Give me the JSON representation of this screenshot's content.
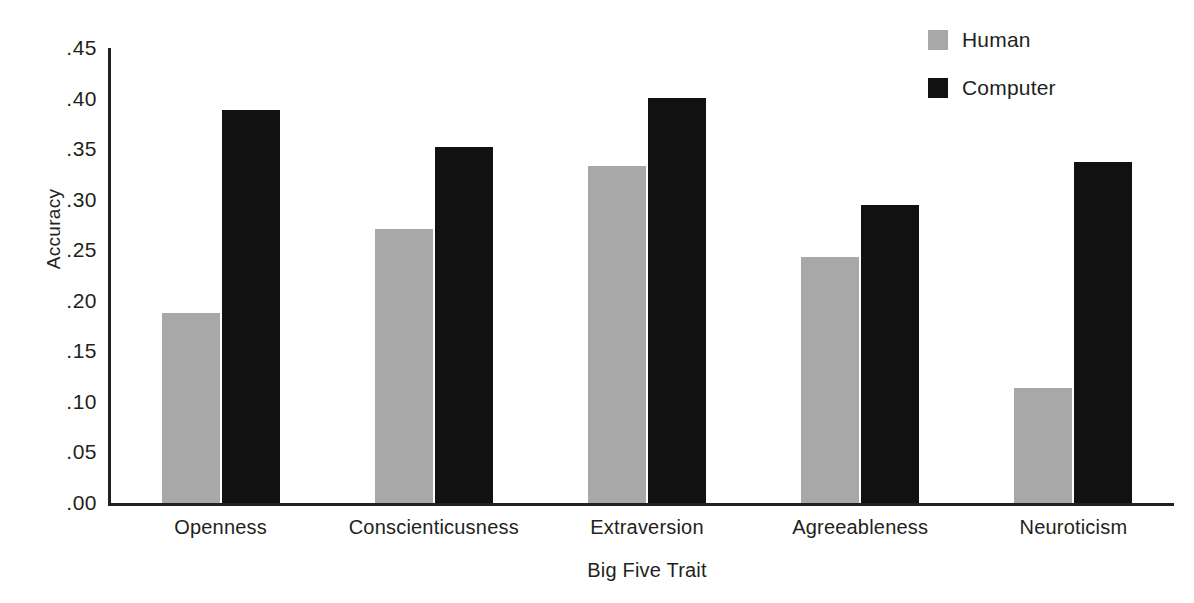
{
  "chart_data": {
    "type": "bar",
    "title": "",
    "xlabel": "Big Five Trait",
    "ylabel": "Accuracy",
    "categories": [
      "Openness",
      "Conscienticusness",
      "Extraversion",
      "Agreeableness",
      "Neuroticism"
    ],
    "series": [
      {
        "name": "Human",
        "color": "#a8a8a8",
        "values": [
          0.188,
          0.271,
          0.333,
          0.243,
          0.114
        ]
      },
      {
        "name": "Computer",
        "color": "#111111",
        "values": [
          0.389,
          0.352,
          0.401,
          0.295,
          0.337
        ]
      }
    ],
    "ylim": [
      0.0,
      0.45
    ],
    "ytick_values": [
      0.45,
      0.4,
      0.35,
      0.3,
      0.25,
      0.2,
      0.15,
      0.1,
      0.05,
      0.0
    ],
    "ytick_labels": [
      ".45",
      ".40",
      ".35",
      ".30",
      ".25",
      ".20",
      ".15",
      ".10",
      ".05",
      ".00"
    ],
    "grid": false,
    "legend_position": "top-right"
  },
  "legend": {
    "entries": [
      {
        "label": "Human",
        "swatch_name": "legend-swatch-human"
      },
      {
        "label": "Computer",
        "swatch_name": "legend-swatch-computer"
      }
    ]
  },
  "axes": {
    "y_title": "Accuracy",
    "x_title": "Big Five Trait"
  },
  "colors": {
    "human": "#a8a8a8",
    "computer": "#111111",
    "axis": "#231f20",
    "background": "#ffffff"
  }
}
